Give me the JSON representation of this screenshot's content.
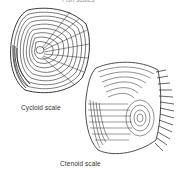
{
  "figure": {
    "top_caption_partial": "Fish scales",
    "scales": [
      {
        "id": "cycloid",
        "label": "Cycloid scale"
      },
      {
        "id": "ctenoid",
        "label": "Ctenoid scale"
      }
    ]
  },
  "colors": {
    "ink": "#222222",
    "background": "#ffffff"
  }
}
